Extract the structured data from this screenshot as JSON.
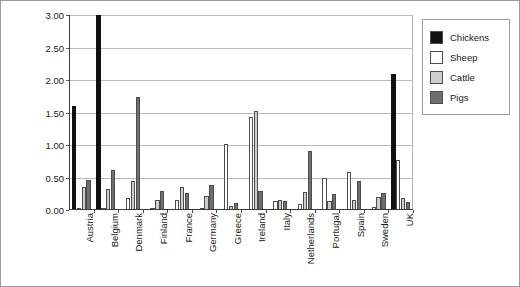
{
  "chart_data": {
    "type": "bar",
    "title": "",
    "xlabel": "",
    "ylabel": "Number of animals per person",
    "ylim": [
      0,
      3.0
    ],
    "ytick_labels": [
      "0.00",
      "0.50",
      "1.00",
      "1.50",
      "2.00",
      "2.50",
      "3.00"
    ],
    "ytick_values": [
      0,
      0.5,
      1.0,
      1.5,
      2.0,
      2.5,
      3.0
    ],
    "grid": true,
    "legend_position": "right",
    "categories": [
      "Austria",
      "Belgium",
      "Denmark",
      "Finland",
      "France",
      "Germany",
      "Greece",
      "Ireland",
      "Italy",
      "Netherlands",
      "Portugal",
      "Spain",
      "Sweden",
      "UK"
    ],
    "series": [
      {
        "name": "Chickens",
        "color": "#111111",
        "values": [
          1.6,
          3.05,
          0.0,
          0.0,
          0.0,
          0.0,
          0.0,
          0.0,
          0.0,
          0.0,
          0.0,
          0.0,
          0.0,
          2.09
        ]
      },
      {
        "name": "Sheep",
        "color": "#ffffff",
        "values": [
          0.01,
          0.01,
          0.18,
          0.01,
          0.16,
          0.01,
          1.01,
          1.43,
          0.14,
          0.09,
          0.5,
          0.58,
          0.05,
          0.77
        ]
      },
      {
        "name": "Cattle",
        "color": "#cdcdcd",
        "values": [
          0.36,
          0.32,
          0.44,
          0.15,
          0.36,
          0.22,
          0.06,
          1.53,
          0.15,
          0.27,
          0.14,
          0.15,
          0.2,
          0.18
        ]
      },
      {
        "name": "Pigs",
        "color": "#6e6e6e",
        "values": [
          0.46,
          0.62,
          1.74,
          0.29,
          0.26,
          0.39,
          0.11,
          0.29,
          0.14,
          0.91,
          0.25,
          0.45,
          0.26,
          0.12
        ]
      }
    ]
  },
  "legend": {
    "items": [
      {
        "label": "Chickens"
      },
      {
        "label": "Sheep"
      },
      {
        "label": "Cattle"
      },
      {
        "label": "Pigs"
      }
    ]
  }
}
